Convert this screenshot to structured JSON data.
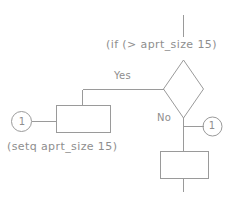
{
  "diagram": {
    "stroke_color": "#9a9a9a",
    "text_color": "#8e8e8e",
    "background_color": "#ffffff",
    "labels": {
      "if_expression": "(if (> aprt_size 15)",
      "setq_expression": "(setq aprt_size 15)",
      "yes_branch": "Yes",
      "no_branch": "No"
    },
    "connectors": [
      {
        "name": "left",
        "number": "1"
      },
      {
        "name": "right",
        "number": "1"
      }
    ],
    "nodes": [
      {
        "name": "decision-diamond",
        "shape": "diamond",
        "label": ""
      },
      {
        "name": "yes-process-box",
        "shape": "rectangle",
        "label": ""
      },
      {
        "name": "no-process-box",
        "shape": "rectangle",
        "label": ""
      }
    ]
  }
}
